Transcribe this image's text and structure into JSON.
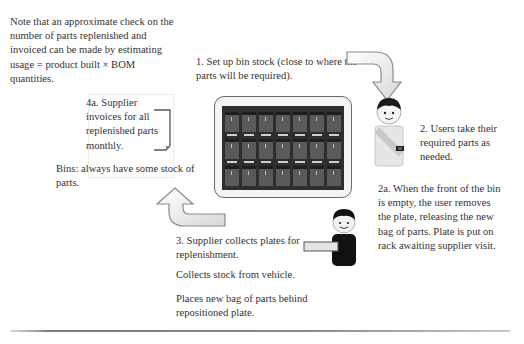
{
  "diagram": {
    "type": "process-cycle",
    "notes": {
      "check_note": [
        "Note that  an approximate check on the",
        "number of parts replenished and",
        "invoiced can be made by estimating",
        "usage = product built × BOM",
        "quantities."
      ],
      "invoice_note": [
        "4a. Supplier",
        "invoices for all",
        "replenished parts",
        "monthly."
      ],
      "bins_note": [
        "Bins: always have some stock of",
        "parts."
      ]
    },
    "steps": [
      {
        "id": "1",
        "lines": [
          "1. Set up bin stock (close to where the",
          "parts will be required)."
        ]
      },
      {
        "id": "2",
        "lines": [
          "2. Users take their",
          "required parts as",
          "needed."
        ]
      },
      {
        "id": "2a",
        "lines": [
          "2a. When the front of the bin",
          "is empty, the user removes",
          "the plate, releasing the new",
          "bag of parts. Plate is put on",
          "rack awaiting supplier visit."
        ]
      },
      {
        "id": "3",
        "lines": [
          "3. Supplier collects plates for",
          "replenishment."
        ]
      },
      {
        "id": "3b",
        "lines": [
          "Collects stock from vehicle."
        ]
      },
      {
        "id": "3c",
        "lines": [
          "Places new bag of parts behind",
          "repositioned plate."
        ]
      }
    ],
    "images": {
      "rack": "bin-rack-image",
      "user": "user-figure-icon",
      "supplier": "supplier-figure-icon"
    },
    "arrows": [
      "curved-arrow-clockwise-top-right",
      "curved-arrow-bottom-left-up"
    ],
    "colors": {
      "text": "#333333",
      "arrow_fill": "#f2f2f2",
      "arrow_stroke": "#8a8a8a",
      "rack_dark": "#2e2e2e",
      "divider": "#7a7a7a"
    }
  }
}
